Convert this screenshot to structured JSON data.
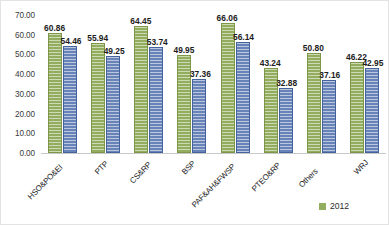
{
  "chart_data": {
    "type": "bar",
    "title": "",
    "xlabel": "",
    "ylabel": "",
    "ylim": [
      0,
      70
    ],
    "ytick_step": 10,
    "grid": false,
    "legend_position": "bottom-right",
    "categories": [
      "HSO&PO&EI",
      "PTP",
      "CS&RP",
      "BSP",
      "PAF&AH&FWSP",
      "PTEO&RP",
      "Others",
      "WRJ"
    ],
    "ytick_labels": [
      "0.00",
      "10.00",
      "20.00",
      "30.00",
      "40.00",
      "50.00",
      "60.00",
      "70.00"
    ],
    "series": [
      {
        "name": "2012",
        "color": "#93ad5e",
        "values": [
          60.86,
          55.94,
          64.45,
          49.95,
          66.06,
          43.24,
          50.8,
          46.22
        ],
        "labels": [
          "60.86",
          "55.94",
          "64.45",
          "49.95",
          "66.06",
          "43.24",
          "50.80",
          "46.22"
        ]
      },
      {
        "name": "series-2",
        "color": "#6783b8",
        "values": [
          54.46,
          49.25,
          53.74,
          37.36,
          56.14,
          32.88,
          37.16,
          42.95
        ],
        "labels": [
          "54.46",
          "49.25",
          "53.74",
          "37.36",
          "56.14",
          "32.88",
          "37.16",
          "42.95"
        ]
      }
    ],
    "legend": [
      {
        "label": "2012",
        "color": "#93ad5e"
      }
    ]
  }
}
